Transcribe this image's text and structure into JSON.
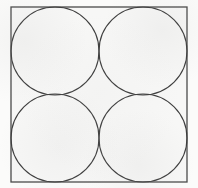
{
  "figure": {
    "background_color": "#fbfbfa",
    "canvas": {
      "width": 198,
      "height": 188
    },
    "square": {
      "name": "bounding-square",
      "x": 11,
      "y": 7,
      "width": 176,
      "height": 175,
      "stroke_color": "#4a4a4a",
      "stroke_width": 1.3,
      "fill_color": "#f7f7f6"
    },
    "circles": [
      {
        "name": "circle-top-left",
        "label": "top-left",
        "cx": 55,
        "cy": 51,
        "r": 44,
        "stroke_color": "#3d3d3d",
        "stroke_width": 1.1,
        "fill_color": "none"
      },
      {
        "name": "circle-top-right",
        "label": "top-right",
        "cx": 143,
        "cy": 51,
        "r": 44,
        "stroke_color": "#3d3d3d",
        "stroke_width": 1.1,
        "fill_color": "none"
      },
      {
        "name": "circle-bottom-left",
        "label": "bottom-left",
        "cx": 55,
        "cy": 138,
        "r": 44,
        "stroke_color": "#3d3d3d",
        "stroke_width": 1.1,
        "fill_color": "none"
      },
      {
        "name": "circle-bottom-right",
        "label": "bottom-right",
        "cx": 143,
        "cy": 138,
        "r": 44,
        "stroke_color": "#3d3d3d",
        "stroke_width": 1.1,
        "fill_color": "none"
      }
    ],
    "tangency_points": [
      {
        "name": "center-tangency",
        "x": 99,
        "y": 95
      },
      {
        "name": "top-edge-tangency-left",
        "x": 55,
        "y": 7
      },
      {
        "name": "top-edge-tangency-right",
        "x": 143,
        "y": 7
      },
      {
        "name": "bottom-edge-tangency-left",
        "x": 55,
        "y": 182
      },
      {
        "name": "bottom-edge-tangency-right",
        "x": 143,
        "y": 182
      },
      {
        "name": "left-edge-tangency-top",
        "x": 11,
        "y": 51
      },
      {
        "name": "left-edge-tangency-bottom",
        "x": 11,
        "y": 138
      },
      {
        "name": "right-edge-tangency-top",
        "x": 187,
        "y": 51
      },
      {
        "name": "right-edge-tangency-bottom",
        "x": 187,
        "y": 138
      }
    ]
  }
}
